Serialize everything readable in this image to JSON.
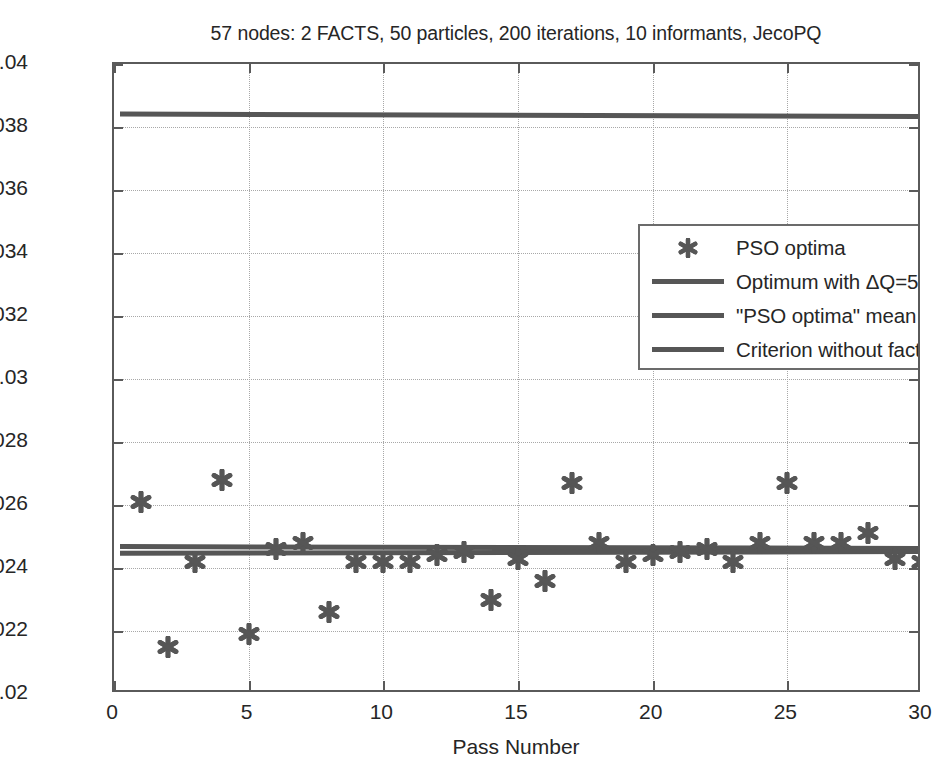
{
  "chart_data": {
    "type": "scatter",
    "title": "57 nodes: 2 FACTS, 50 particles, 200 iterations, 10 informants, JecoPQ",
    "xlabel": "Pass Number",
    "ylabel": "Obtained optimum",
    "xlim": [
      0,
      30
    ],
    "ylim": [
      0.02,
      0.04
    ],
    "xticks": [
      0,
      5,
      10,
      15,
      20,
      25,
      30
    ],
    "xtick_labels": [
      "0",
      "5",
      "10",
      "15",
      "20",
      "25",
      "30"
    ],
    "yticks": [
      0.02,
      0.022,
      0.024,
      0.026,
      0.028,
      0.03,
      0.032,
      0.034,
      0.036,
      0.038,
      0.04
    ],
    "ytick_labels": [
      "0.02",
      "0.022",
      "0.024",
      "0.026",
      "0.028",
      "0.03",
      "0.032",
      "0.034",
      "0.036",
      "0.038",
      "0.04"
    ],
    "grid": true,
    "legend_position": "upper right",
    "marker_color": "#565656",
    "line_color": "#565656",
    "axis_color": "#5a5a5a",
    "grid_color": "#a8a8a8",
    "series": [
      {
        "name": "PSO optima",
        "type": "scatter",
        "marker": "hexagram",
        "x": [
          1,
          2,
          3,
          4,
          5,
          6,
          7,
          8,
          9,
          10,
          11,
          12,
          13,
          14,
          15,
          16,
          17,
          18,
          19,
          20,
          21,
          22,
          23,
          24,
          25,
          26,
          27,
          28,
          29,
          30
        ],
        "values": [
          0.0261,
          0.0215,
          0.0242,
          0.0268,
          0.0219,
          0.0246,
          0.0248,
          0.0226,
          0.0242,
          0.0242,
          0.0242,
          0.0244,
          0.0245,
          0.023,
          0.0243,
          0.0236,
          0.0267,
          0.0248,
          0.0242,
          0.0244,
          0.0245,
          0.0246,
          0.0242,
          0.0248,
          0.0267,
          0.0248,
          0.0248,
          0.0251,
          0.0243,
          0.0242
        ]
      },
      {
        "name": "Optimum with ΔQ=5MVAR",
        "type": "line",
        "value_start": 0.02468,
        "value_end": 0.02462
      },
      {
        "name": "\"PSO optima\" mean",
        "type": "line",
        "value_start": 0.02447,
        "value_end": 0.02452
      },
      {
        "name": "Criterion without facts",
        "type": "line",
        "value_start": 0.03841,
        "value_end": 0.03833
      }
    ]
  },
  "legend": {
    "items": [
      {
        "label": "PSO optima",
        "symbol": "marker"
      },
      {
        "label": "Optimum with ΔQ=5MVAR",
        "symbol": "line"
      },
      {
        "label": "\"PSO optima\" mean",
        "symbol": "line"
      },
      {
        "label": "Criterion without facts",
        "symbol": "line"
      }
    ]
  }
}
